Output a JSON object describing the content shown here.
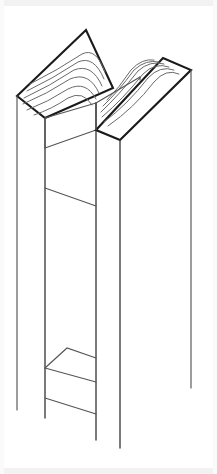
{
  "image": {
    "title": "Isometric line drawing of a notched timber joint",
    "subject": "two-post-lap-joint",
    "style": "technical-line-drawing",
    "background_color": "#ffffff",
    "line_color": "#1a1a1a",
    "secondary_line_color": "#555555",
    "grain_color": "#6a6a6a",
    "width": 217,
    "height": 474
  },
  "parts": [
    {
      "id": "left-post",
      "label": "Left post",
      "end_grain_visible": true,
      "grain_arc_count": 6
    },
    {
      "id": "right-post",
      "label": "Right post",
      "end_grain_visible": true,
      "grain_arc_count": 6
    },
    {
      "id": "center-notch",
      "label": "Center notch",
      "end_grain_visible": false
    },
    {
      "id": "lower-notch",
      "label": "Lower notch",
      "end_grain_visible": false
    }
  ],
  "geometry": {
    "top_band_height": 6,
    "bottom_band_height": 6,
    "side_band_width": 4
  }
}
